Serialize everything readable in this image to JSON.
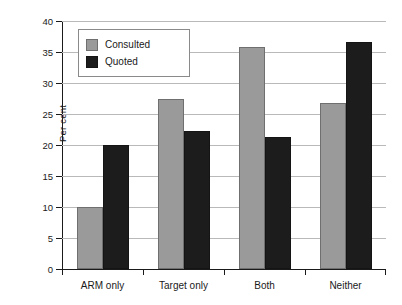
{
  "chart_data": {
    "type": "bar",
    "title": "",
    "xlabel": "",
    "ylabel": "Per cent",
    "ylim": [
      0,
      40
    ],
    "yticks": [
      0,
      5,
      10,
      15,
      20,
      25,
      30,
      35,
      40
    ],
    "ytick_labels": [
      "0",
      "5",
      "10",
      "15",
      "20",
      "25",
      "30",
      "35",
      "40"
    ],
    "grid": true,
    "legend_position": "upper left inside plot",
    "categories": [
      "ARM only",
      "Target only",
      "Both",
      "Neither"
    ],
    "series": [
      {
        "name": "Consulted",
        "color": "#9a9a9a",
        "values": [
          10.0,
          27.5,
          35.8,
          26.7
        ]
      },
      {
        "name": "Quoted",
        "color": "#1c1c1c",
        "values": [
          20.0,
          22.2,
          21.3,
          36.6
        ]
      }
    ]
  },
  "colors": {
    "consulted": "#9a9a9a",
    "quoted": "#1c1c1c",
    "gridline": "#b9b9b9",
    "axis": "#1a1a1a",
    "background": "#ffffff"
  }
}
